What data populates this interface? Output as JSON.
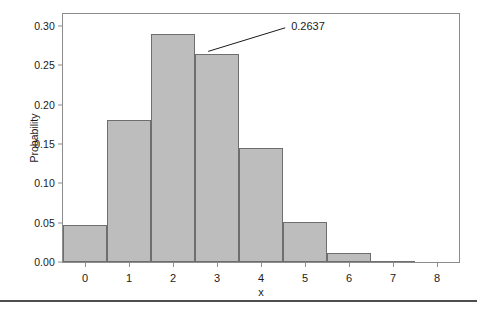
{
  "chart_data": {
    "type": "bar",
    "title": "",
    "subtitle": "",
    "xlabel": "x",
    "ylabel": "Probability",
    "categories": [
      0,
      1,
      2,
      3,
      4,
      5,
      6,
      7,
      8
    ],
    "values": [
      0.047,
      0.18,
      0.29,
      0.2637,
      0.1447,
      0.051,
      0.011,
      0.0013,
      0.0001
    ],
    "series": [
      {
        "name": "Probability",
        "values": [
          0.047,
          0.18,
          0.29,
          0.2637,
          0.1447,
          0.051,
          0.011,
          0.0013,
          0.0001
        ]
      }
    ],
    "xlim": [
      -0.5,
      8.5
    ],
    "ylim": [
      0.0,
      0.315
    ],
    "ytick_labels": [
      "0.00",
      "0.05",
      "0.10",
      "0.15",
      "0.20",
      "0.25",
      "0.30"
    ],
    "ytick_values": [
      0.0,
      0.05,
      0.1,
      0.15,
      0.2,
      0.25,
      0.3
    ],
    "xtick_labels": [
      "0",
      "1",
      "2",
      "3",
      "4",
      "5",
      "6",
      "7",
      "8"
    ],
    "xtick_values": [
      0,
      1,
      2,
      3,
      4,
      5,
      6,
      7,
      8
    ],
    "grid": false,
    "legend": false,
    "legend_position": "none",
    "bar_fill_color": "#bdbdbd",
    "bar_edge_color": "#6e6e6e",
    "frame_color": "#8c8c8c",
    "annotations": [
      {
        "label": "0.2637",
        "points_to_category": 3,
        "points_to_value": 0.2637,
        "text_x": 0.2637,
        "color": "#1a1a1a"
      }
    ]
  },
  "annotation_label": "0.2637",
  "axis": {
    "x_title": "x",
    "y_title": "Probability"
  }
}
